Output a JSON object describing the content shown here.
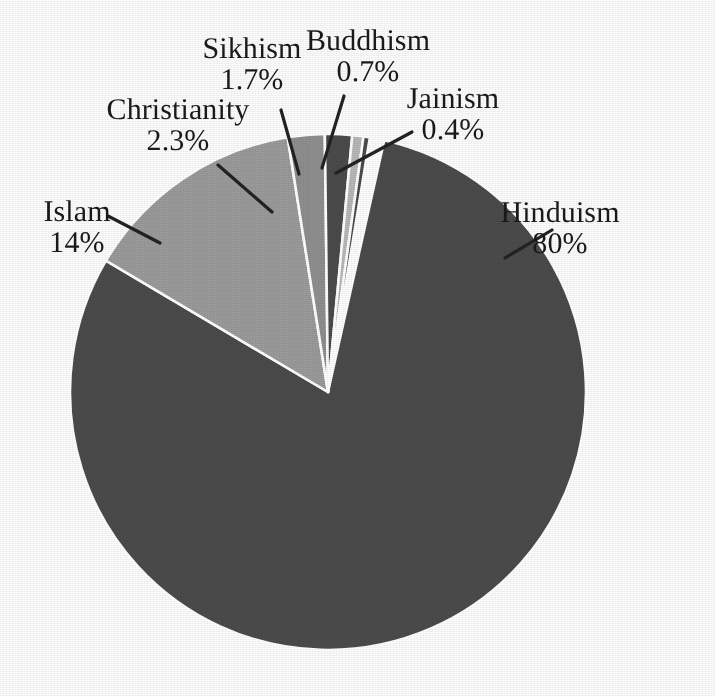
{
  "chart_data": {
    "type": "pie",
    "title": "",
    "subtitle": "",
    "xlabel": "",
    "ylabel": "",
    "legend_position": "none",
    "grid": false,
    "labels_on_slices": false,
    "label_style": "outside-with-leader-lines",
    "categories": [
      "Hinduism",
      "Islam",
      "Christianity",
      "Sikhism",
      "Buddhism",
      "Jainism"
    ],
    "values": [
      80,
      14,
      2.3,
      1.7,
      0.7,
      0.4
    ],
    "value_labels": [
      "80%",
      "14%",
      "2.3%",
      "1.7%",
      "0.7%",
      "0.4%"
    ],
    "units": "percent",
    "slices": [
      {
        "name": "Hinduism",
        "value": 80,
        "display": "80%",
        "color": "#4b4b4b",
        "start_deg": 12.6,
        "sweep_deg": 288.0
      },
      {
        "name": "Islam",
        "value": 14,
        "display": "14%",
        "color": "#9b9b9b",
        "start_deg": 300.6,
        "sweep_deg": 50.4
      },
      {
        "name": "Christianity",
        "value": 2.3,
        "display": "2.3%",
        "color": "#8f8f8f",
        "start_deg": 351.0,
        "sweep_deg": 8.28
      },
      {
        "name": "Sikhism",
        "value": 1.7,
        "display": "1.7%",
        "color": "#4b4b4b",
        "start_deg": 359.3,
        "sweep_deg": 6.12
      },
      {
        "name": "Buddhism",
        "value": 0.7,
        "display": "0.7%",
        "color": "#b8b8b8",
        "start_deg": 5.4,
        "sweep_deg": 2.52
      },
      {
        "name": "Jainism",
        "value": 0.4,
        "display": "0.4%",
        "color": "#4b4b4b",
        "start_deg": 7.9,
        "sweep_deg": 1.44
      }
    ],
    "colors": [
      "#4b4b4b",
      "#9b9b9b",
      "#8f8f8f",
      "#4b4b4b",
      "#b8b8b8",
      "#4b4b4b"
    ]
  },
  "labels": {
    "hinduism": {
      "name": "Hinduism",
      "percent": "80%"
    },
    "islam": {
      "name": "Islam",
      "percent": "14%"
    },
    "christianity": {
      "name": "Christianity",
      "percent": "2.3%"
    },
    "sikhism": {
      "name": "Sikhism",
      "percent": "1.7%"
    },
    "buddhism": {
      "name": "Buddhism",
      "percent": "0.7%"
    },
    "jainism": {
      "name": "Jainism",
      "percent": "0.4%"
    }
  },
  "geometry": {
    "center_x": 328,
    "center_y": 392,
    "radius": 258
  },
  "style": {
    "background": "#fdfdfd",
    "text_color": "#1a1a1a",
    "leader_line_color": "#222222",
    "slice_separator_color": "#ffffff"
  }
}
